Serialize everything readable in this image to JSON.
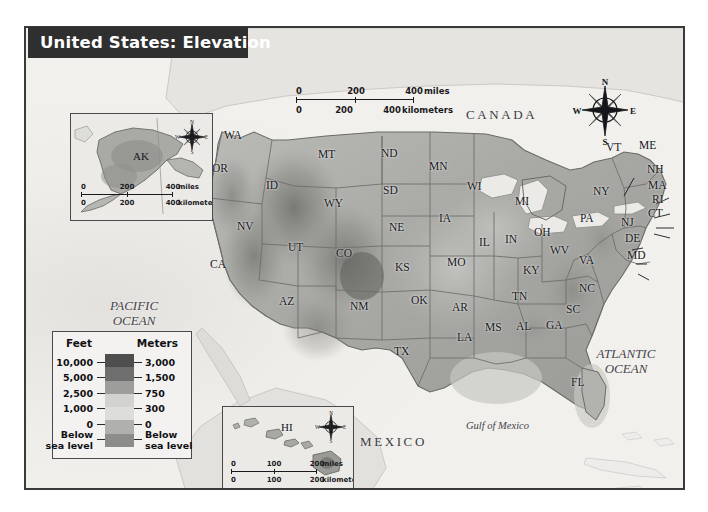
{
  "title": "United States: Elevation",
  "map": {
    "countries": [
      {
        "name": "CANADA",
        "x": 440,
        "y": 80
      },
      {
        "name": "MEXICO",
        "x": 334,
        "y": 407
      }
    ],
    "water_labels": [
      {
        "name": "PACIFIC\nOCEAN",
        "line1": "PACIFIC",
        "line2": "OCEAN",
        "x": 82,
        "y": 278
      },
      {
        "name": "ATLANTIC\nOCEAN",
        "line1": "ATLANTIC",
        "line2": "OCEAN",
        "x": 570,
        "y": 325
      },
      {
        "name": "Gulf of Mexico",
        "x": 466,
        "y": 397
      }
    ],
    "states": [
      {
        "abbr": "WA",
        "x": 222,
        "y": 128
      },
      {
        "abbr": "OR",
        "x": 210,
        "y": 161
      },
      {
        "abbr": "ID",
        "x": 264,
        "y": 178
      },
      {
        "abbr": "MT",
        "x": 316,
        "y": 147
      },
      {
        "abbr": "ND",
        "x": 379,
        "y": 146
      },
      {
        "abbr": "MN",
        "x": 427,
        "y": 159
      },
      {
        "abbr": "WI",
        "x": 465,
        "y": 179
      },
      {
        "abbr": "MI",
        "x": 513,
        "y": 194
      },
      {
        "abbr": "SD",
        "x": 381,
        "y": 183
      },
      {
        "abbr": "WY",
        "x": 322,
        "y": 196
      },
      {
        "abbr": "NV",
        "x": 235,
        "y": 219
      },
      {
        "abbr": "NE",
        "x": 387,
        "y": 220
      },
      {
        "abbr": "IA",
        "x": 437,
        "y": 211
      },
      {
        "abbr": "IL",
        "x": 477,
        "y": 235
      },
      {
        "abbr": "IN",
        "x": 503,
        "y": 232
      },
      {
        "abbr": "OH",
        "x": 532,
        "y": 225
      },
      {
        "abbr": "UT",
        "x": 286,
        "y": 240
      },
      {
        "abbr": "CO",
        "x": 334,
        "y": 246
      },
      {
        "abbr": "CA",
        "x": 208,
        "y": 257
      },
      {
        "abbr": "KS",
        "x": 393,
        "y": 260
      },
      {
        "abbr": "MO",
        "x": 445,
        "y": 255
      },
      {
        "abbr": "KY",
        "x": 521,
        "y": 263
      },
      {
        "abbr": "WV",
        "x": 548,
        "y": 243
      },
      {
        "abbr": "VA",
        "x": 577,
        "y": 253
      },
      {
        "abbr": "NC",
        "x": 577,
        "y": 281
      },
      {
        "abbr": "TN",
        "x": 510,
        "y": 289
      },
      {
        "abbr": "SC",
        "x": 564,
        "y": 302
      },
      {
        "abbr": "AZ",
        "x": 277,
        "y": 294
      },
      {
        "abbr": "NM",
        "x": 348,
        "y": 299
      },
      {
        "abbr": "OK",
        "x": 409,
        "y": 293
      },
      {
        "abbr": "AR",
        "x": 450,
        "y": 300
      },
      {
        "abbr": "MS",
        "x": 483,
        "y": 320
      },
      {
        "abbr": "AL",
        "x": 514,
        "y": 319
      },
      {
        "abbr": "GA",
        "x": 544,
        "y": 318
      },
      {
        "abbr": "LA",
        "x": 455,
        "y": 330
      },
      {
        "abbr": "TX",
        "x": 392,
        "y": 344
      },
      {
        "abbr": "FL",
        "x": 569,
        "y": 375
      },
      {
        "abbr": "VT",
        "x": 604,
        "y": 140
      },
      {
        "abbr": "ME",
        "x": 637,
        "y": 138
      },
      {
        "abbr": "NH",
        "x": 645,
        "y": 162
      },
      {
        "abbr": "MA",
        "x": 646,
        "y": 178
      },
      {
        "abbr": "RI",
        "x": 650,
        "y": 192
      },
      {
        "abbr": "CT",
        "x": 646,
        "y": 206
      },
      {
        "abbr": "NY",
        "x": 591,
        "y": 184
      },
      {
        "abbr": "PA",
        "x": 578,
        "y": 211
      },
      {
        "abbr": "NJ",
        "x": 619,
        "y": 215
      },
      {
        "abbr": "DE",
        "x": 623,
        "y": 231
      },
      {
        "abbr": "MD",
        "x": 625,
        "y": 248
      }
    ]
  },
  "insets": {
    "alaska": {
      "label": "AK",
      "scale": {
        "miles": {
          "ticks": [
            "0",
            "200",
            "400"
          ],
          "unit": "miles"
        },
        "km": {
          "ticks": [
            "0",
            "200",
            "400"
          ],
          "unit": "kilometers"
        }
      }
    },
    "hawaii": {
      "label": "HI",
      "scale": {
        "miles": {
          "ticks": [
            "0",
            "100",
            "200"
          ],
          "unit": "miles"
        },
        "km": {
          "ticks": [
            "0",
            "100",
            "200"
          ],
          "unit": "kilometers"
        }
      }
    }
  },
  "main_scale": {
    "miles": {
      "ticks": [
        "0",
        "200",
        "400"
      ],
      "unit": "miles"
    },
    "km": {
      "ticks": [
        "0",
        "200",
        "400"
      ],
      "unit": "kilometers"
    }
  },
  "compass": {
    "n": "N",
    "e": "E",
    "s": "S",
    "w": "W"
  },
  "legend": {
    "header_left": "Feet",
    "header_right": "Meters",
    "rows": [
      {
        "feet": "10,000",
        "meters": "3,000",
        "color": "#5c5c5c"
      },
      {
        "feet": "5,000",
        "meters": "1,500",
        "color": "#8d8d8d"
      },
      {
        "feet": "2,500",
        "meters": "750",
        "color": "#c9c9c7"
      },
      {
        "feet": "1,000",
        "meters": "300",
        "color": "#d9d9d7"
      },
      {
        "feet": "0",
        "meters": "0",
        "color": "#a6a6a4"
      },
      {
        "feet": "Below sea level",
        "meters": "Below sea level",
        "color": "#8a8a88",
        "feet_l1": "Below",
        "feet_l2": "sea level",
        "meters_l1": "Below",
        "meters_l2": "sea level"
      }
    ],
    "ramp_colors": [
      "#4e4e4e",
      "#6e6e6e",
      "#9d9d9b",
      "#d2d2d0",
      "#dddddb",
      "#b0b0ae",
      "#8c8c8a"
    ]
  }
}
